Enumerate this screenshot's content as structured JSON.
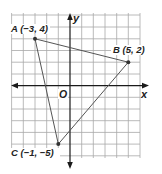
{
  "figure": {
    "type": "coordinate-plane-triangle",
    "axes": {
      "x_label": "x",
      "y_label": "y",
      "origin_label": "O"
    },
    "grid": {
      "x_min": -5,
      "x_max": 6,
      "y_min": -6,
      "y_max": 6
    },
    "points": [
      {
        "name": "A",
        "x": -3,
        "y": 4,
        "label": "A (−3, 4)"
      },
      {
        "name": "B",
        "x": 5,
        "y": 2,
        "label": "B (5, 2)"
      },
      {
        "name": "C",
        "x": -1,
        "y": -5,
        "label": "C (−1, −5)"
      }
    ],
    "colors": {
      "grid": "#9a9a9a",
      "axes": "#1a1a1a",
      "triangle": "#555555",
      "point": "#333333"
    }
  }
}
